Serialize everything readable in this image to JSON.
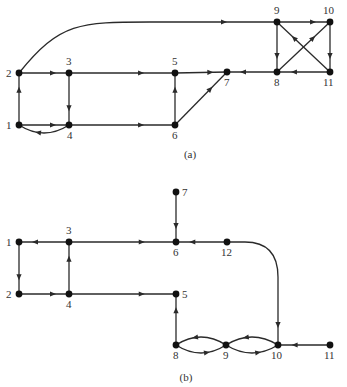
{
  "diagrams": [
    {
      "id": "a",
      "caption": "(a)",
      "caption_pos": [
        190,
        158
      ],
      "nodes": [
        {
          "id": "1",
          "label": "1",
          "x": 19,
          "y": 125,
          "lx": 6,
          "ly": 129
        },
        {
          "id": "2",
          "label": "2",
          "x": 19,
          "y": 73,
          "lx": 6,
          "ly": 77
        },
        {
          "id": "3",
          "label": "3",
          "x": 69,
          "y": 73,
          "lx": 66,
          "ly": 65
        },
        {
          "id": "4",
          "label": "4",
          "x": 69,
          "y": 125,
          "lx": 67,
          "ly": 139
        },
        {
          "id": "5",
          "label": "5",
          "x": 175,
          "y": 73,
          "lx": 172,
          "ly": 65
        },
        {
          "id": "6",
          "label": "6",
          "x": 175,
          "y": 125,
          "lx": 172,
          "ly": 139
        },
        {
          "id": "7",
          "label": "7",
          "x": 227,
          "y": 72,
          "lx": 224,
          "ly": 86
        },
        {
          "id": "8",
          "label": "8",
          "x": 277,
          "y": 72,
          "lx": 274,
          "ly": 86
        },
        {
          "id": "9",
          "label": "9",
          "x": 277,
          "y": 22,
          "lx": 274,
          "ly": 14
        },
        {
          "id": "10",
          "label": "10",
          "x": 330,
          "y": 22,
          "lx": 323,
          "ly": 14
        },
        {
          "id": "11",
          "label": "11",
          "x": 330,
          "y": 72,
          "lx": 323,
          "ly": 86
        }
      ],
      "edges": [
        {
          "from": "1",
          "to": "2"
        },
        {
          "from": "2",
          "to": "3"
        },
        {
          "from": "3",
          "to": "4"
        },
        {
          "from": "1",
          "to": "4"
        },
        {
          "from": "4",
          "to": "1",
          "curve": "below"
        },
        {
          "from": "3",
          "to": "5"
        },
        {
          "from": "4",
          "to": "6"
        },
        {
          "from": "6",
          "to": "5"
        },
        {
          "from": "5",
          "to": "7"
        },
        {
          "from": "6",
          "to": "7"
        },
        {
          "from": "2",
          "to": "9",
          "curve": "arc-top"
        },
        {
          "from": "9",
          "to": "10"
        },
        {
          "from": "9",
          "to": "8"
        },
        {
          "from": "10",
          "to": "11"
        },
        {
          "from": "11",
          "to": "8"
        },
        {
          "from": "8",
          "to": "10"
        },
        {
          "from": "11",
          "to": "9"
        },
        {
          "from": "8",
          "to": "7"
        }
      ]
    },
    {
      "id": "b",
      "caption": "(b)",
      "caption_pos": [
        186,
        381
      ],
      "nodes": [
        {
          "id": "1",
          "label": "1",
          "x": 19,
          "y": 242,
          "lx": 6,
          "ly": 246
        },
        {
          "id": "2",
          "label": "2",
          "x": 19,
          "y": 294,
          "lx": 6,
          "ly": 298
        },
        {
          "id": "3",
          "label": "3",
          "x": 69,
          "y": 242,
          "lx": 66,
          "ly": 234
        },
        {
          "id": "4",
          "label": "4",
          "x": 69,
          "y": 294,
          "lx": 66,
          "ly": 308
        },
        {
          "id": "5",
          "label": "5",
          "x": 176,
          "y": 294,
          "lx": 182,
          "ly": 298
        },
        {
          "id": "6",
          "label": "6",
          "x": 176,
          "y": 242,
          "lx": 173,
          "ly": 256
        },
        {
          "id": "7",
          "label": "7",
          "x": 176,
          "y": 192,
          "lx": 182,
          "ly": 196
        },
        {
          "id": "8",
          "label": "8",
          "x": 176,
          "y": 345,
          "lx": 173,
          "ly": 359
        },
        {
          "id": "9",
          "label": "9",
          "x": 226,
          "y": 345,
          "lx": 223,
          "ly": 359
        },
        {
          "id": "10",
          "label": "10",
          "x": 278,
          "y": 345,
          "lx": 271,
          "ly": 359
        },
        {
          "id": "11",
          "label": "11",
          "x": 330,
          "y": 345,
          "lx": 324,
          "ly": 359
        },
        {
          "id": "12",
          "label": "12",
          "x": 227,
          "y": 242,
          "lx": 221,
          "ly": 256
        }
      ],
      "edges": [
        {
          "from": "3",
          "to": "1"
        },
        {
          "from": "1",
          "to": "2"
        },
        {
          "from": "2",
          "to": "4"
        },
        {
          "from": "4",
          "to": "3"
        },
        {
          "from": "3",
          "to": "6"
        },
        {
          "from": "4",
          "to": "5"
        },
        {
          "from": "7",
          "to": "6"
        },
        {
          "from": "12",
          "to": "6"
        },
        {
          "from": "12",
          "to": "10",
          "curve": "corner"
        },
        {
          "from": "8",
          "to": "5"
        },
        {
          "from": "8",
          "to": "9",
          "curve": "below"
        },
        {
          "from": "9",
          "to": "8",
          "curve": "above"
        },
        {
          "from": "9",
          "to": "10",
          "curve": "below"
        },
        {
          "from": "10",
          "to": "9",
          "curve": "above"
        },
        {
          "from": "11",
          "to": "10"
        }
      ]
    }
  ]
}
